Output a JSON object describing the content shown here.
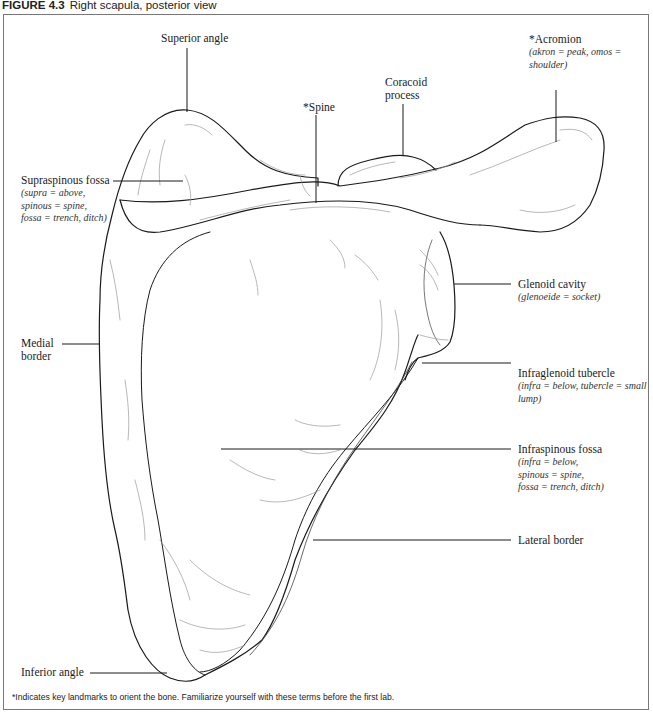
{
  "figure": {
    "number": "FIGURE 4.3",
    "title": "Right scapula, posterior view"
  },
  "labels": {
    "superior_angle": {
      "term": "Superior angle"
    },
    "acromion": {
      "term": "*Acromion",
      "etymology": [
        "(akron = peak, omos =",
        "shoulder)"
      ]
    },
    "coracoid_process": {
      "term_lines": [
        "Coracoid",
        "process"
      ]
    },
    "spine": {
      "term": "*Spine"
    },
    "supraspinous_fossa": {
      "term": "Supraspinous fossa",
      "etymology": [
        "(supra = above,",
        "spinous = spine,",
        "fossa = trench, ditch)"
      ]
    },
    "glenoid_cavity": {
      "term": "Glenoid cavity",
      "etymology": [
        "(glenoeide = socket)"
      ]
    },
    "medial_border": {
      "term_lines": [
        "Medial",
        "border"
      ]
    },
    "infraglenoid_tubercle": {
      "term": "Infraglenoid tubercle",
      "etymology": [
        "(infra = below, tubercle = small",
        "lump)"
      ]
    },
    "infraspinous_fossa": {
      "term": "Infraspinous fossa",
      "etymology": [
        "(infra = below,",
        "spinous = spine,",
        "fossa = trench, ditch)"
      ]
    },
    "lateral_border": {
      "term": "Lateral border"
    },
    "inferior_angle": {
      "term": "Inferior angle"
    }
  },
  "footnote": "*Indicates key landmarks to orient the bone. Familiarize yourself with these terms before the first lab.",
  "colors": {
    "outline": "#1a1a1a",
    "shading": "#9a9a9a",
    "frame": "#777777",
    "leader": "#1a1a1a"
  }
}
